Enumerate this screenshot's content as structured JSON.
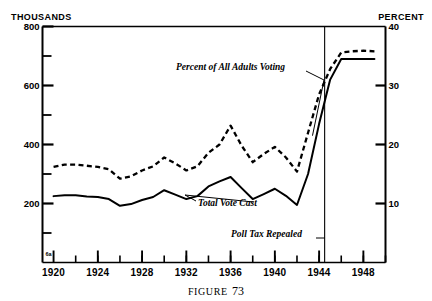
{
  "figure": {
    "caption_prefix": "FIGURE",
    "caption_number": "73",
    "corner_mark": "6a"
  },
  "axes": {
    "left_title": "THOUSANDS",
    "right_title": "PERCENT",
    "left_ticks": [
      "800",
      "600",
      "400",
      "200"
    ],
    "left_minor_ticks": [
      "700",
      "500",
      "300",
      "100"
    ],
    "right_ticks": [
      "40",
      "30",
      "20",
      "10"
    ],
    "x_ticks": [
      "1920",
      "1924",
      "1928",
      "1932",
      "1936",
      "1940",
      "1944",
      "1948"
    ]
  },
  "annotations": {
    "percent_label": "Percent of All Adults Voting",
    "total_label": "Total Vote Cast",
    "event_label": "Poll Tax Repealed"
  },
  "chart_data": {
    "type": "line",
    "title": "FIGURE 73",
    "xlabel": "",
    "ylabel": "THOUSANDS",
    "y2label": "PERCENT",
    "xlim": [
      1919,
      1950
    ],
    "ylim": [
      0,
      800
    ],
    "y2lim": [
      0,
      40
    ],
    "grid": false,
    "legend": "none",
    "x": [
      1920,
      1921,
      1922,
      1923,
      1924,
      1925,
      1926,
      1927,
      1928,
      1929,
      1930,
      1931,
      1932,
      1933,
      1934,
      1935,
      1936,
      1937,
      1938,
      1939,
      1940,
      1941,
      1942,
      1943,
      1944,
      1945,
      1946,
      1947,
      1948,
      1949
    ],
    "series": [
      {
        "name": "Total Vote Cast",
        "axis": "left",
        "units": "thousands",
        "style": "solid",
        "values": [
          225,
          228,
          228,
          224,
          222,
          215,
          192,
          198,
          212,
          222,
          245,
          230,
          215,
          225,
          258,
          275,
          290,
          252,
          215,
          232,
          250,
          226,
          195,
          300,
          470,
          620,
          690,
          690,
          690,
          690
        ]
      },
      {
        "name": "Percent of All Adults Voting",
        "axis": "right",
        "units": "percent",
        "style": "dashed",
        "values": [
          16.2,
          16.6,
          16.6,
          16.4,
          16.2,
          15.8,
          14.2,
          14.6,
          15.6,
          16.3,
          17.8,
          16.8,
          15.6,
          16.3,
          18.6,
          20.0,
          23.2,
          19.8,
          17.0,
          18.4,
          19.6,
          17.8,
          15.4,
          22.0,
          28.5,
          32.8,
          35.6,
          35.8,
          35.9,
          35.8
        ]
      }
    ],
    "event_line": {
      "x": 1944.5,
      "label": "Poll Tax Repealed"
    }
  }
}
